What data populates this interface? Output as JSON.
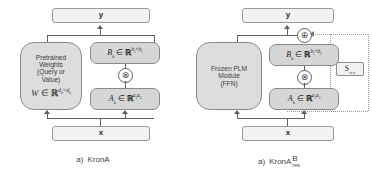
{
  "figure": {
    "panels": [
      {
        "id": "krona",
        "caption_label": "a)",
        "caption_name": "KronA",
        "io": {
          "output": "y",
          "input": "x"
        },
        "frozen_block": {
          "line1": "Pretrained",
          "line2": "Weights",
          "line3": "(Query or",
          "line4": "Value)",
          "formula_var": "W",
          "formula_in": "∈",
          "formula_field": "ℝ",
          "formula_exp_1": "d",
          "formula_exp_1_sub": "h",
          "formula_exp_times": "×",
          "formula_exp_2": "d",
          "formula_exp_2_sub": "h"
        },
        "matrix_b": {
          "var": "B",
          "var_sub": "k",
          "in": "∈",
          "field": "ℝ",
          "exp_1": "b",
          "exp_1_sub": "1",
          "exp_times": "×",
          "exp_2": "b",
          "exp_2_sub": "2"
        },
        "matrix_a": {
          "var": "A",
          "var_sub": "k",
          "in": "∈",
          "field": "ℝ",
          "exp_1": "a",
          "exp_1_sub": "1",
          "exp_2": "a",
          "exp_2_sub": "2"
        },
        "operators": {
          "kron": "⊗"
        }
      },
      {
        "id": "krona-b-res",
        "caption_label": "a)",
        "caption_name": "KronA",
        "caption_sup": "B",
        "caption_sub": "res",
        "io": {
          "output": "y",
          "input": "x"
        },
        "frozen_block": {
          "line1": "Frozen PLM",
          "line2": "Module",
          "line3": "(FFN)"
        },
        "matrix_b": {
          "var": "B",
          "var_sub": "k",
          "in": "∈",
          "field": "ℝ",
          "exp_1": "b",
          "exp_1_sub": "1",
          "exp_times": "×",
          "exp_2": "b",
          "exp_2_sub": "2"
        },
        "matrix_a": {
          "var": "A",
          "var_sub": "k",
          "in": "∈",
          "field": "ℝ",
          "exp_1": "a",
          "exp_1_sub": "1",
          "exp_2": "a",
          "exp_2_sub": "2"
        },
        "scale_box": {
          "var": "S",
          "sub": "res"
        },
        "operators": {
          "kron": "⊗",
          "add": "⊕"
        }
      }
    ],
    "colors": {
      "box_fill": "#d6d6d6",
      "io_fill": "#f2f2f2",
      "border": "#8a8a8a",
      "line": "#5e5e5e",
      "dotted": "#9a9a9a",
      "text": "#3a3a3a",
      "background": "#ffffff"
    }
  }
}
